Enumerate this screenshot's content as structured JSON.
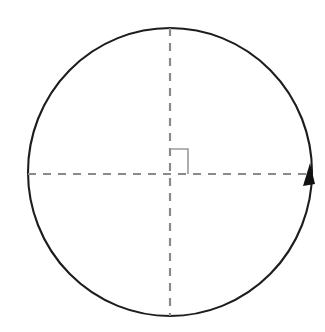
{
  "figure": {
    "background_color": "#ffffff",
    "width": 325,
    "height": 332
  },
  "chart_data": {
    "type": "diagram",
    "title": "",
    "subtitle": "",
    "xlabel": "",
    "ylabel": "",
    "grid": false,
    "legend": null,
    "annotations": [],
    "center": {
      "x": 170,
      "y": 172
    },
    "shapes": [
      {
        "name": "circle-outline",
        "kind": "ellipse",
        "cx": 170,
        "cy": 172,
        "rx": 142,
        "ry": 144,
        "stroke_color": "#1d1d1d",
        "stroke_width": 2.1,
        "fill": "none",
        "dashed": false
      },
      {
        "name": "horizontal-diameter",
        "kind": "line",
        "x1": 28,
        "y1": 174,
        "x2": 312,
        "y2": 174,
        "stroke_color": "#8a8a8a",
        "stroke_width": 2.2,
        "dashed": true,
        "dash_pattern": "8 7"
      },
      {
        "name": "vertical-diameter",
        "kind": "line",
        "x1": 170,
        "y1": 28,
        "x2": 170,
        "y2": 316,
        "stroke_color": "#8a8a8a",
        "stroke_width": 2.2,
        "dashed": true,
        "dash_pattern": "8 7"
      },
      {
        "name": "right-angle-marker",
        "kind": "polyline",
        "points": "170,149 188,149 188,174",
        "stroke_color": "#9a9a9a",
        "stroke_width": 1.6,
        "fill": "none",
        "quadrant": "upper-right"
      },
      {
        "name": "direction-arrowhead",
        "kind": "triangle",
        "tip": {
          "x": 310,
          "y": 163
        },
        "base_left": {
          "x": 303,
          "y": 186
        },
        "base_right": {
          "x": 315,
          "y": 184
        },
        "fill_color": "#111111",
        "direction": "counterclockwise",
        "position_on_circle": "right"
      }
    ],
    "colors": {
      "circle_stroke": "#1d1d1d",
      "dashed_axis": "#8a8a8a",
      "right_angle_marker": "#9a9a9a",
      "arrowhead": "#111111",
      "background": "#ffffff"
    }
  }
}
